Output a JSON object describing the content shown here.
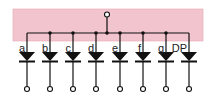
{
  "diagram": {
    "colors": {
      "background": "#ffffff",
      "housing": "#f2c4ce",
      "housing_border": "#e8a9b7",
      "wire": "#111111"
    },
    "common_terminal": "common-anode",
    "segments": [
      {
        "label": "a"
      },
      {
        "label": "b"
      },
      {
        "label": "c"
      },
      {
        "label": "d"
      },
      {
        "label": "e"
      },
      {
        "label": "f"
      },
      {
        "label": "g"
      },
      {
        "label": "DP"
      }
    ]
  }
}
